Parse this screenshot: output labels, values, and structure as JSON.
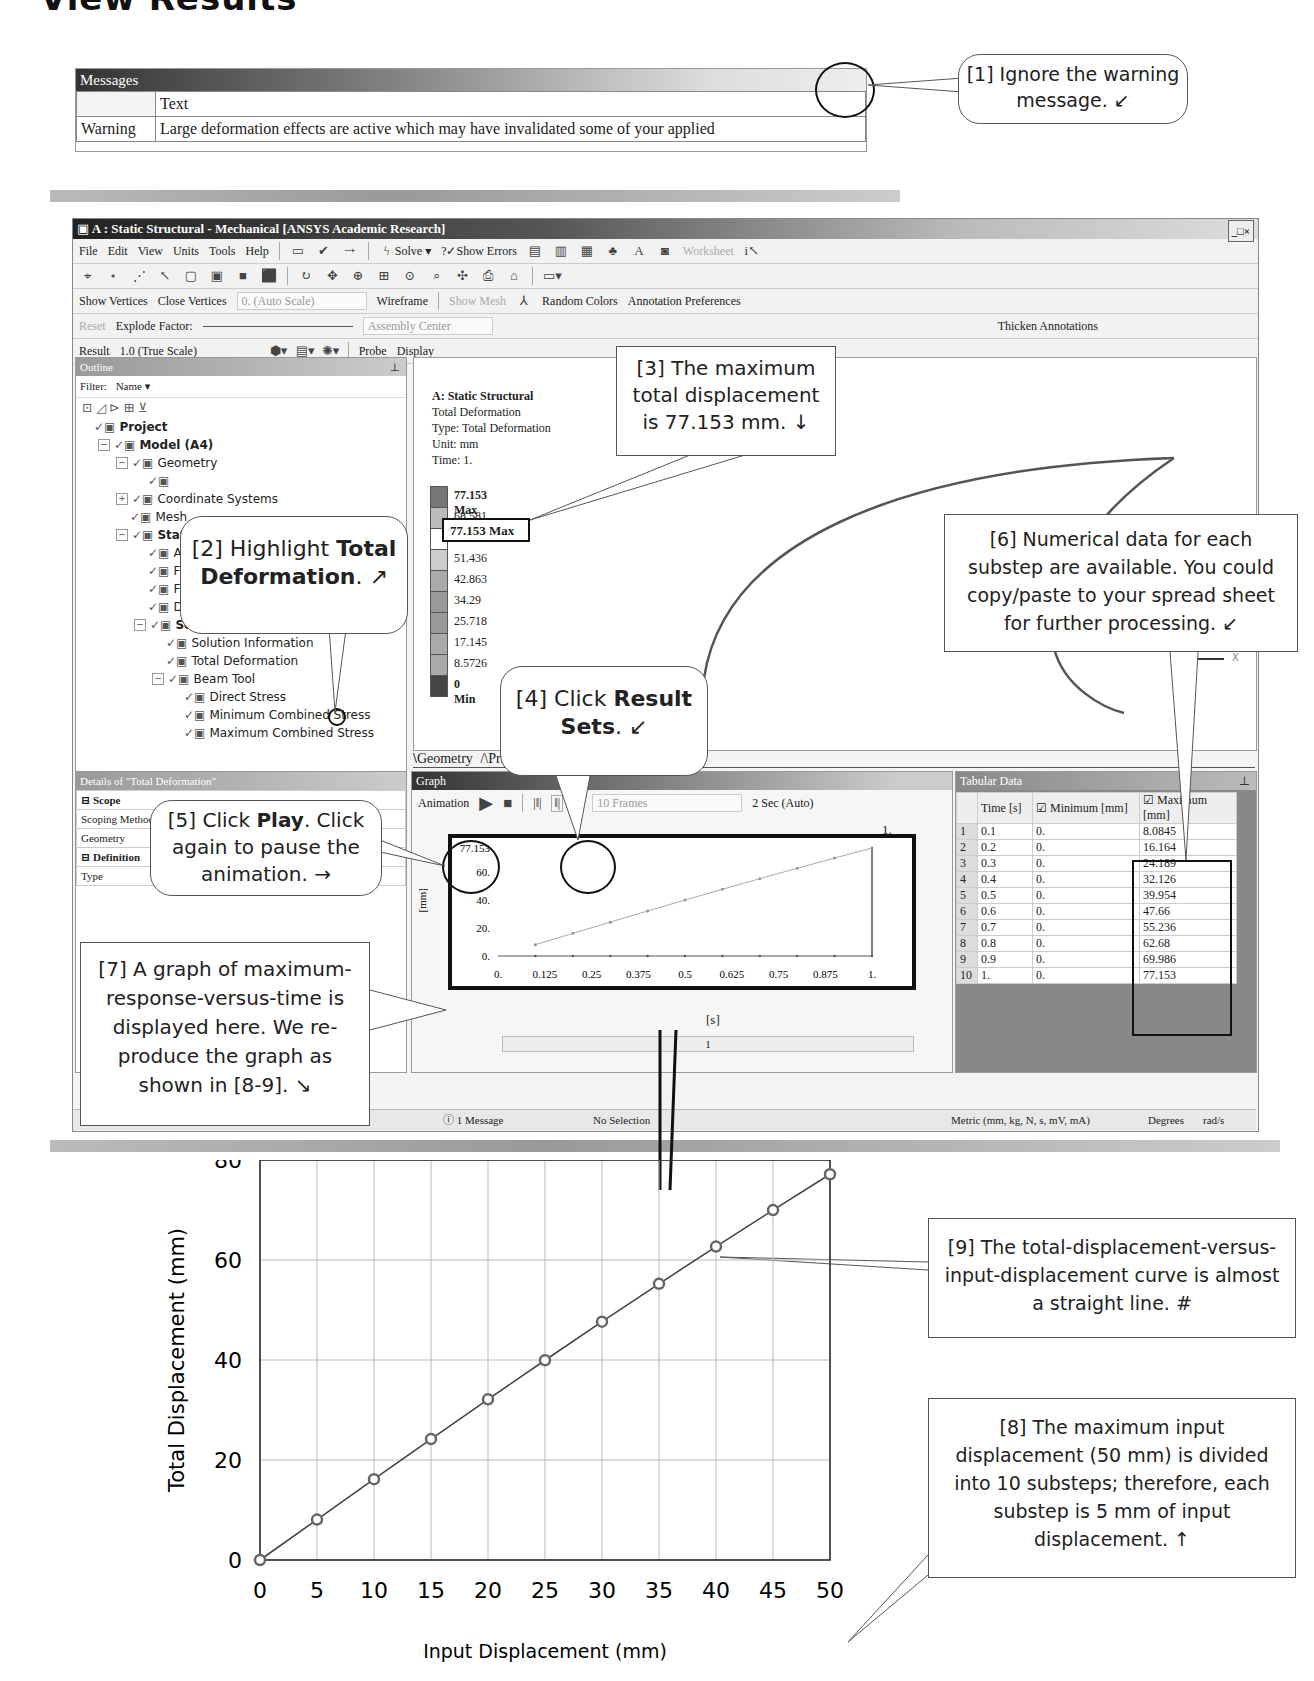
{
  "heading": "View Results",
  "messages": {
    "title": "Messages",
    "column_header": "Text",
    "rows": [
      {
        "type": "Warning",
        "text": "Large deformation effects are active which may have invalidated some of your applied"
      }
    ]
  },
  "app": {
    "title": "A : Static Structural - Mechanical [ANSYS Academic Research]",
    "window_buttons": "_□×",
    "menu": [
      "File",
      "Edit",
      "View",
      "Units",
      "Tools",
      "Help"
    ],
    "toolbar1": {
      "solve": "Solve",
      "show_errors": "?✓Show Errors",
      "worksheet": "Worksheet"
    },
    "toolbar3": {
      "show_vertices": "Show Vertices",
      "close_vertices": "Close Vertices",
      "scale": "0. (Auto Scale)",
      "wireframe": "Wireframe",
      "show_mesh": "Show Mesh",
      "random_colors": "Random Colors",
      "annotation_preferences": "Annotation Preferences"
    },
    "toolbar4": {
      "reset": "Reset",
      "explode_factor": "Explode Factor:",
      "assembly_center": "Assembly Center",
      "thicken_annotations": "Thicken Annotations"
    },
    "toolbar5": {
      "result_label": "Result",
      "result_scale": "1.0 (True Scale)",
      "probe": "Probe",
      "display": "Display"
    },
    "outline": {
      "title": "Outline",
      "filter_label": "Filter:",
      "filter_value": "Name",
      "tree": [
        {
          "label": "Project",
          "level": 0,
          "bold": true,
          "toggle": ""
        },
        {
          "label": "Model (A4)",
          "level": 1,
          "bold": true,
          "toggle": "−"
        },
        {
          "label": "Geometry",
          "level": 2,
          "bold": false,
          "toggle": "−"
        },
        {
          "label": "",
          "level": 3,
          "bold": false,
          "toggle": ""
        },
        {
          "label": "Coordinate Systems",
          "level": 2,
          "bold": false,
          "toggle": "+"
        },
        {
          "label": "Mesh",
          "level": 2,
          "bold": false,
          "toggle": ""
        },
        {
          "label": "Static Structural (A5)",
          "level": 2,
          "bold": true,
          "toggle": "−"
        },
        {
          "label": "Analysis Settings",
          "level": 3,
          "bold": false,
          "toggle": ""
        },
        {
          "label": "Fixed Support",
          "level": 3,
          "bold": false,
          "toggle": ""
        },
        {
          "label": "Fixed Rotation",
          "level": 3,
          "bold": false,
          "toggle": ""
        },
        {
          "label": "Displacement",
          "level": 3,
          "bold": false,
          "toggle": ""
        },
        {
          "label": "Solution (A6)",
          "level": 3,
          "bold": true,
          "toggle": "−"
        },
        {
          "label": "Solution Information",
          "level": 4,
          "bold": false,
          "toggle": ""
        },
        {
          "label": "Total Deformation",
          "level": 4,
          "bold": false,
          "toggle": ""
        },
        {
          "label": "Beam Tool",
          "level": 4,
          "bold": false,
          "toggle": "−"
        },
        {
          "label": "Direct Stress",
          "level": 5,
          "bold": false,
          "toggle": ""
        },
        {
          "label": "Minimum Combined Stress",
          "level": 5,
          "bold": false,
          "toggle": ""
        },
        {
          "label": "Maximum Combined Stress",
          "level": 5,
          "bold": false,
          "toggle": ""
        }
      ]
    },
    "viewport": {
      "title": "A: Static Structural",
      "result": "Total Deformation",
      "type": "Type: Total Deformation",
      "unit": "Unit: mm",
      "time": "Time: 1.",
      "legend": [
        "77.153 Max",
        "68.581",
        "60.008",
        "51.436",
        "42.863",
        "34.29",
        "25.718",
        "17.145",
        "8.5726",
        "0 Min"
      ],
      "legend_colors": [
        "#777777",
        "#bbbbbb",
        "#ffffff",
        "#cccccc",
        "#aaaaaa",
        "#999999",
        "#999999",
        "#aaaaaa",
        "#aaaaaa",
        "#444444"
      ],
      "axis_y": "Y",
      "axis_x": "X"
    },
    "tabs": [
      "Geometry",
      "Print Preview",
      "Report Preview"
    ],
    "details": {
      "title": "Details of \"Total Deformation\"",
      "rows": [
        {
          "k": "Scope",
          "v": "",
          "section": true
        },
        {
          "k": "Scoping Method",
          "v": "",
          "section": false
        },
        {
          "k": "Geometry",
          "v": "",
          "section": false
        },
        {
          "k": "Definition",
          "v": "",
          "section": true
        },
        {
          "k": "Type",
          "v": "Total Deformation",
          "section": false
        }
      ]
    },
    "graph": {
      "title": "Graph",
      "animation_label": "Animation",
      "frames": "10 Frames",
      "duration": "2 Sec (Auto)",
      "y_ticks": [
        "77.153",
        "60.",
        "40.",
        "20.",
        "0."
      ],
      "x_ticks": [
        "0.",
        "0.125",
        "0.25",
        "0.375",
        "0.5",
        "0.625",
        "0.75",
        "0.875",
        "1."
      ],
      "y_label": "[mm]",
      "x_label": "[s]",
      "top_label": "1.",
      "slider_value": "1"
    },
    "tabular": {
      "title": "Tabular Data",
      "headers": [
        "",
        "Time [s]",
        "Minimum [mm]",
        "Maximum [mm]"
      ],
      "rows": [
        [
          "1",
          "0.1",
          "0.",
          "8.0845"
        ],
        [
          "2",
          "0.2",
          "0.",
          "16.164"
        ],
        [
          "3",
          "0.3",
          "0.",
          "24.189"
        ],
        [
          "4",
          "0.4",
          "0.",
          "32.126"
        ],
        [
          "5",
          "0.5",
          "0.",
          "39.954"
        ],
        [
          "6",
          "0.6",
          "0.",
          "47.66"
        ],
        [
          "7",
          "0.7",
          "0.",
          "55.236"
        ],
        [
          "8",
          "0.8",
          "0.",
          "62.68"
        ],
        [
          "9",
          "0.9",
          "0.",
          "69.986"
        ],
        [
          "10",
          "1.",
          "0.",
          "77.153"
        ]
      ]
    },
    "statusbar": {
      "messages": "1 Message",
      "selection": "No Selection",
      "units": "Metric (mm, kg, N, s, mV, mA)",
      "angle": "Degrees",
      "rot": "rad/s"
    }
  },
  "callouts": {
    "c1": "[1] Ignore the warning message. ↙",
    "c2_pre": "[2] Highlight ",
    "c2_bold1": "Total",
    "c2_bold2": "Deformation",
    "c2_post": ". ↗",
    "c3": "[3] The maximum total displacement is 77.153 mm. ↓",
    "c4_pre": "[4] Click ",
    "c4_bold1": "Result",
    "c4_bold2": "Sets",
    "c4_post": ". ↙",
    "c5_pre": "[5] Click ",
    "c5_bold": "Play",
    "c5_post": ". Click again to pause the animation. →",
    "c6": "[6] Numerical data for each substep are available. You could copy/paste to your spread sheet for further processing. ↙",
    "c7": "[7] A graph of maximum-response-versus-time is displayed here. We re-produce the graph as shown in [8-9]. ↘",
    "c8": "[8] The maximum input displacement (50 mm) is divided into 10 substeps; therefore, each substep is 5 mm of input displacement. ↑",
    "c9": "[9] The total-displacement-versus-input-displacement curve is almost a straight line. #"
  },
  "chart_data": {
    "type": "line",
    "title": "",
    "xlabel": "Input Displacement (mm)",
    "ylabel": "Total Displacement (mm)",
    "x": [
      0,
      5,
      10,
      15,
      20,
      25,
      30,
      35,
      40,
      45,
      50
    ],
    "values": [
      0,
      8.0845,
      16.164,
      24.189,
      32.126,
      39.954,
      47.66,
      55.236,
      62.68,
      69.986,
      77.153
    ],
    "x_ticks": [
      "0",
      "5",
      "10",
      "15",
      "20",
      "25",
      "30",
      "35",
      "40",
      "45",
      "50"
    ],
    "y_ticks": [
      "0",
      "20",
      "40",
      "60",
      "80"
    ],
    "xlim": [
      0,
      50
    ],
    "ylim": [
      0,
      80
    ],
    "grid": true,
    "markers": "open-circle"
  }
}
